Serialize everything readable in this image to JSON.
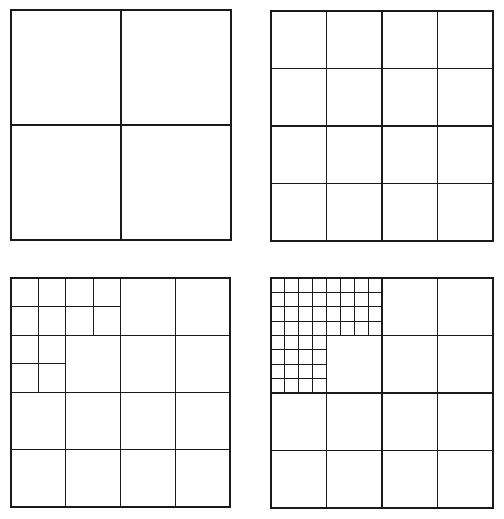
{
  "diagram": {
    "title": "",
    "line_color": "#1a1a1a",
    "background": "#ffffff",
    "panels": [
      {
        "id": "panel-1",
        "label": "",
        "base_grid": 2,
        "box": {
          "x": 11,
          "y": 10,
          "w": 220,
          "h": 230
        },
        "refined": []
      },
      {
        "id": "panel-2",
        "label": "",
        "base_grid": 4,
        "box": {
          "x": 271,
          "y": 11,
          "w": 222,
          "h": 230
        },
        "refined": []
      },
      {
        "id": "panel-3",
        "label": "",
        "base_grid": 4,
        "box": {
          "x": 11,
          "y": 278,
          "w": 219,
          "h": 229
        },
        "refined": [
          {
            "row": 0,
            "col": 0,
            "split": 2
          },
          {
            "row": 0,
            "col": 1,
            "split": 2
          },
          {
            "row": 1,
            "col": 0,
            "split": 2
          }
        ]
      },
      {
        "id": "panel-4",
        "label": "",
        "base_grid": 4,
        "box": {
          "x": 271,
          "y": 278,
          "w": 222,
          "h": 230
        },
        "refined": [
          {
            "row": 0,
            "col": 0,
            "split": 4
          },
          {
            "row": 0,
            "col": 1,
            "split": 4
          },
          {
            "row": 1,
            "col": 0,
            "split": 4
          }
        ]
      }
    ]
  }
}
